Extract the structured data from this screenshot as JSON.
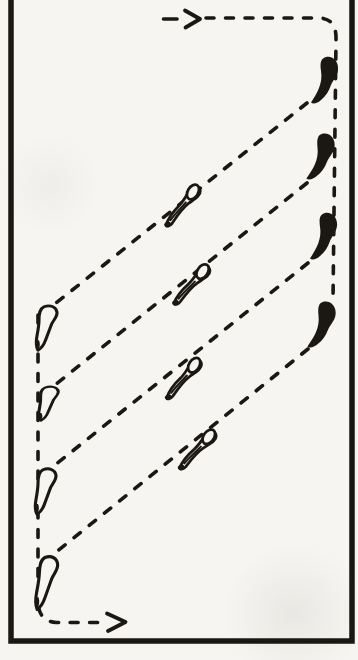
{
  "figure": {
    "background_color": "#f6f5f1",
    "ink_color": "#1b1712",
    "frame": {
      "left_x": 11,
      "right_x": 352,
      "bottom_y": 641,
      "top_open": true,
      "thickness": 5.5
    },
    "route": {
      "stroke_width": 3.6,
      "dash_pattern": "8 11.5",
      "segments": [
        {
          "name": "entry-lead-dash",
          "d": "M163.5 19 L177 19",
          "dashed": false
        },
        {
          "name": "entry-run-and-right-column",
          "d": "M206 18 L320 18 Q336.5 19 336 39 L333 300",
          "dashed": true
        },
        {
          "name": "transect-line-1",
          "d": "M307 103 L46 311",
          "dashed": true
        },
        {
          "name": "transect-line-2",
          "d": "M307 183 L45 393",
          "dashed": true
        },
        {
          "name": "transect-line-3",
          "d": "M308 263 L45 473",
          "dashed": true
        },
        {
          "name": "transect-line-4",
          "d": "M308 349 L45 561",
          "dashed": true
        },
        {
          "name": "left-column-and-exit-run",
          "d": "M38 315 L38 602 Q38.5 621 56 622.5 L102 622.5",
          "dashed": true
        }
      ],
      "arrowheads": [
        {
          "name": "entry-arrowhead",
          "points": "185,10.5 200,19 185.5,27.5"
        },
        {
          "name": "exit-arrowhead",
          "points": "107,613.5 125.5,622 108,631"
        }
      ]
    },
    "animals": {
      "filled_comma_right_column": {
        "parts": [
          {
            "d": "M16 0 C23 -1.5 29 5 28 13 C27.2 19 23 23 21 28 C19 34 16 39 11 43 C8 46 3 47.5 1 45.5 C4 41 7 36 9 31 C11 26 12 20 11 14 C10 6 10.5 1.5 16 0 Z",
            "fill": "ink"
          }
        ],
        "instances": [
          {
            "x": 310,
            "y": 57,
            "rot": 0
          },
          {
            "x": 307,
            "y": 133,
            "rot": 2
          },
          {
            "x": 309,
            "y": 213,
            "rot": 0
          },
          {
            "x": 308,
            "y": 301,
            "rot": 2
          }
        ]
      },
      "outline_comma_left_column": {
        "parts": [
          {
            "d": "M13 2 C19.5 -1 25.5 2.5 26 8.5 C26.3 13.5 22.5 17 20.5 22 C18.5 28 16.5 34 14.5 40 C13 45 10 49.5 7 51.5 C5 47.5 5 41 6 35 C7 28.5 8 23 8 17 C8 10 8.5 4.5 13 2 Z",
            "fill": "paper",
            "stroke_width": 3.1
          },
          {
            "d": "M8 40 C9.5 44 9 48 7 51 C5.5 48 5.5 43.5 6.5 40 Z",
            "fill": "ink"
          }
        ],
        "instances": [
          {
            "x": 31,
            "y": 305,
            "rot": 0,
            "sy": 0.88
          },
          {
            "x": 32,
            "y": 387,
            "rot": -3,
            "sy": 0.66
          },
          {
            "x": 30,
            "y": 468,
            "rot": 0,
            "sy": 0.9
          },
          {
            "x": 32,
            "y": 555,
            "rot": 2,
            "sy": 1.05
          }
        ]
      },
      "outline_tadpole_on_transect": {
        "parts": [
          {
            "d": "M-25 7 C-18 2 -10 0.5 -3 -0.5 C4 -1.5 9 -4.5 15 -6.5 C21 -8 25 -4 22.5 0.5 C20 4.5 13 3.5 5.5 3.5 C-2 3.5 -11 6.5 -19.5 9.5 C-23 10.5 -27 9 -25 7 Z",
            "fill": "paper",
            "stroke_width": 2.8
          },
          {
            "ellipse": [
              16,
              -3,
              8,
              5.2,
              -22
            ],
            "fill": "paper",
            "stroke_width": 2.8
          },
          {
            "d": "M-19 6 C-11 3.5 -3 2.5 4 1",
            "fill": "none",
            "stroke_width": 2
          },
          {
            "d": "M-26.5 5.5 C-24 4 -21 5 -20.5 7.2 C-20 9.4 -23 11 -25.5 9.8 C-27.3 8.9 -27.6 6.6 -26.5 5.5 Z",
            "fill": "ink"
          }
        ],
        "instances": [
          {
            "x": 182,
            "y": 204,
            "rot": -37
          },
          {
            "x": 191,
            "y": 283,
            "rot": -34
          },
          {
            "x": 183,
            "y": 377,
            "rot": -36
          },
          {
            "x": 197,
            "y": 448,
            "rot": -33
          }
        ]
      }
    }
  }
}
